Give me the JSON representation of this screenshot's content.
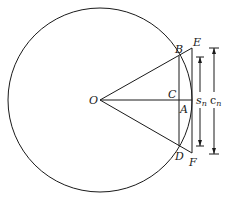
{
  "diagram": {
    "colors": {
      "stroke": "#1a1a1a",
      "background": "#ffffff"
    },
    "circle": {
      "cx": 100,
      "cy": 100,
      "r": 92
    },
    "points": {
      "O": {
        "label": "O",
        "x": 100,
        "y": 100
      },
      "B": {
        "label": "B",
        "x": 179,
        "y": 56
      },
      "D": {
        "label": "D",
        "x": 179,
        "y": 146
      },
      "C": {
        "label": "C",
        "x": 179,
        "y": 100
      },
      "A": {
        "label": "A",
        "x": 192,
        "y": 100
      },
      "E": {
        "label": "E",
        "x": 192,
        "y": 48
      },
      "F": {
        "label": "F",
        "x": 192,
        "y": 153
      }
    },
    "dimensions": {
      "s_n": {
        "label": "s",
        "subscript": "n",
        "x": 200,
        "y1": 57,
        "y2": 146
      },
      "c_n": {
        "label": "c",
        "subscript": "n",
        "x": 214,
        "y1": 48,
        "y2": 154
      }
    }
  }
}
